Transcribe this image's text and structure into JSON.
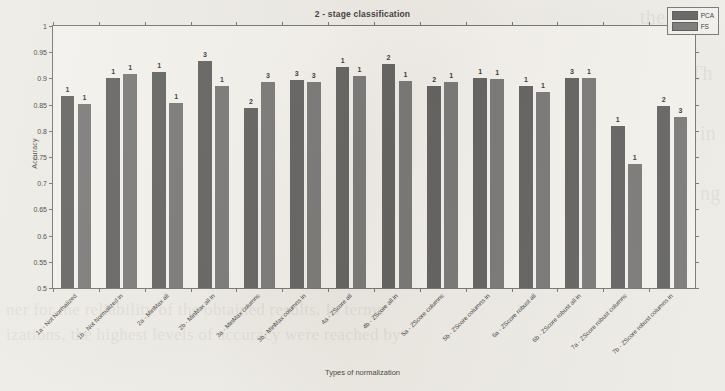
{
  "chart_data": {
    "type": "bar",
    "title": "2 - stage classification",
    "xlabel": "Types of normalization",
    "ylabel": "Accuracy",
    "ylim": [
      0.5,
      1
    ],
    "ytick_labels": [
      "0.5",
      "0.55",
      "0.6",
      "0.65",
      "0.7",
      "0.75",
      "0.8",
      "0.85",
      "0.9",
      "0.95",
      "1"
    ],
    "ytick_values": [
      0.5,
      0.55,
      0.6,
      0.65,
      0.7,
      0.75,
      0.8,
      0.85,
      0.9,
      0.95,
      1
    ],
    "grid": false,
    "legend_position": "top-right",
    "categories": [
      "1a - Not Normalized",
      "1b - Not Normalized in",
      "2a - MinMax all",
      "2b - MinMax all in",
      "3a - MinMax columns",
      "3b - MinMax columns in",
      "4a - ZScore all",
      "4b - ZScore all in",
      "5a - ZScore columns",
      "5b - ZScore columns in",
      "6a - ZScore robust all",
      "6b - ZScore robust all in",
      "7a - ZScore robust columns",
      "7b - ZScore robust columns in"
    ],
    "series": [
      {
        "name": "PCA",
        "color": "#565656",
        "values": [
          0.866,
          0.9,
          0.912,
          0.934,
          0.843,
          0.897,
          0.921,
          0.928,
          0.885,
          0.9,
          0.885,
          0.901,
          0.81,
          0.848
        ],
        "point_labels": [
          "1",
          "1",
          "1",
          "3",
          "2",
          "3",
          "1",
          "2",
          "2",
          "1",
          "1",
          "3",
          "1",
          "2"
        ]
      },
      {
        "name": "FS",
        "color": "#6f6f6f",
        "values": [
          0.851,
          0.908,
          0.853,
          0.885,
          0.893,
          0.894,
          0.905,
          0.895,
          0.893,
          0.898,
          0.874,
          0.901,
          0.737,
          0.826
        ],
        "point_labels": [
          "1",
          "1",
          "1",
          "1",
          "3",
          "3",
          "1",
          "1",
          "1",
          "1",
          "1",
          "1",
          "1",
          "3"
        ]
      }
    ]
  },
  "legend": {
    "entries": [
      {
        "label": "PCA"
      },
      {
        "label": "FS"
      }
    ]
  },
  "background_text": {
    "lines": [
      "the p",
      "Th",
      "in",
      "ng",
      "ner for the reliability of the obtained results. In terms",
      "izations, the highest levels of accuracy were reached by"
    ]
  }
}
